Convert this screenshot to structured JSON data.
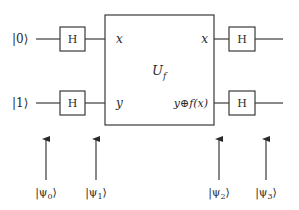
{
  "diagram": {
    "type": "quantum-circuit",
    "inputs": [
      {
        "label": "|0⟩"
      },
      {
        "label": "|1⟩"
      }
    ],
    "gates": {
      "hadamard_label": "H"
    },
    "oracle": {
      "label_main": "U",
      "label_sub": "f",
      "inputs": [
        "x",
        "y"
      ],
      "outputs": [
        "x",
        "y⊕f(x)"
      ]
    },
    "states": [
      {
        "label_pre": "|ψ",
        "sub": "0",
        "label_post": "⟩"
      },
      {
        "label_pre": "|ψ",
        "sub": "1",
        "label_post": "⟩"
      },
      {
        "label_pre": "|ψ",
        "sub": "2",
        "label_post": "⟩"
      },
      {
        "label_pre": "|ψ",
        "sub": "3",
        "label_post": "⟩"
      }
    ]
  }
}
